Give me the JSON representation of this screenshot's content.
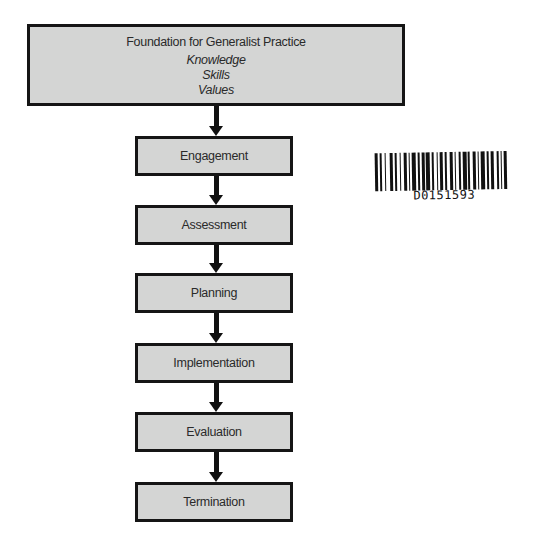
{
  "diagram": {
    "type": "flowchart",
    "orientation": "vertical",
    "foundation": {
      "title": "Foundation for Generalist Practice",
      "items": [
        "Knowledge",
        "Skills",
        "Values"
      ]
    },
    "steps": [
      {
        "label": "Engagement"
      },
      {
        "label": "Assessment"
      },
      {
        "label": "Planning"
      },
      {
        "label": "Implementation"
      },
      {
        "label": "Evaluation"
      },
      {
        "label": "Termination"
      }
    ],
    "colors": {
      "box_fill": "#d4d5d4",
      "box_border": "#151515",
      "arrow": "#111111",
      "background": "#ffffff"
    }
  },
  "barcode": {
    "code": "D0151593"
  }
}
